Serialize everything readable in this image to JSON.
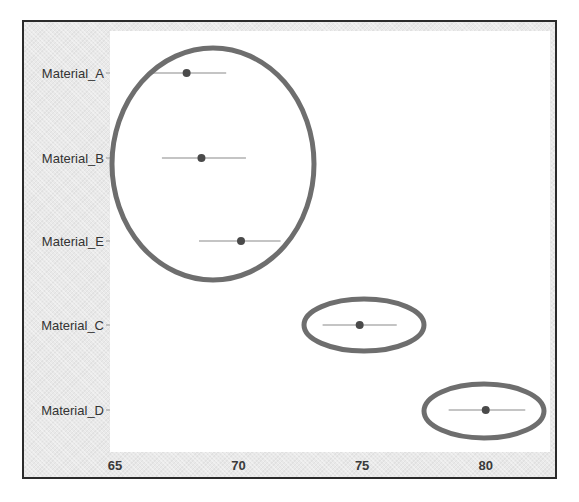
{
  "chart_data": {
    "type": "scatter",
    "subtype": "interval-plot",
    "title": "",
    "xlabel": "",
    "ylabel": "",
    "xlim": [
      64.8,
      82.6
    ],
    "xticks": [
      65,
      70,
      75,
      80
    ],
    "xtick_labels": [
      "65",
      "70",
      "75",
      "80"
    ],
    "grid": false,
    "legend": null,
    "categories": [
      "Material_A",
      "Material_B",
      "Material_E",
      "Material_C",
      "Material_D"
    ],
    "series": [
      {
        "name": "mean",
        "values": [
          67.9,
          68.5,
          70.1,
          74.9,
          80.0
        ]
      },
      {
        "name": "lower",
        "values": [
          66.4,
          66.9,
          68.4,
          73.4,
          78.5
        ]
      },
      {
        "name": "upper",
        "values": [
          69.5,
          70.3,
          71.7,
          76.4,
          81.6
        ]
      }
    ],
    "annotations": [
      {
        "type": "ellipse",
        "groups": [
          "Material_A",
          "Material_B",
          "Material_E"
        ]
      },
      {
        "type": "ellipse",
        "groups": [
          "Material_C"
        ]
      },
      {
        "type": "ellipse",
        "groups": [
          "Material_D"
        ]
      }
    ],
    "colors": {
      "point": "#4a4a4a",
      "interval": "#8a8a8a",
      "ellipse": "#6e6e6e",
      "plot_bg": "#ffffff",
      "frame_bg": "#e9e9e9"
    }
  }
}
